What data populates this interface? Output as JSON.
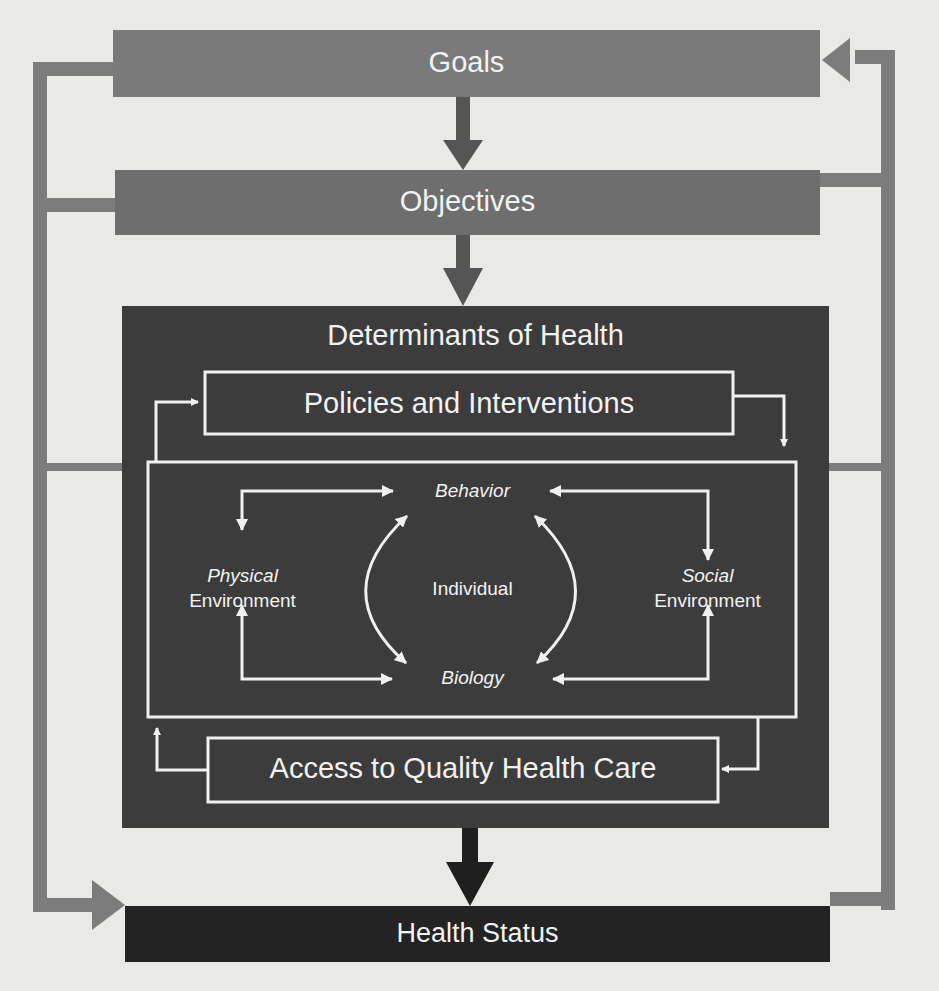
{
  "diagram": {
    "colors": {
      "background": "#e9e9e6",
      "goals_box": "#7a7a7a",
      "objectives_box": "#6e6e6e",
      "determinants_box": "#3c3c3c",
      "health_status_box": "#232323",
      "feedback_lines": "#7c7c7c",
      "inner_lines": "#f0f0f0",
      "text": "#f2f2f2"
    },
    "nodes": {
      "goals": "Goals",
      "objectives": "Objectives",
      "determinants_title": "Determinants of Health",
      "policies": "Policies and Interventions",
      "behavior": "Behavior",
      "physical_1": "Physical",
      "physical_2": "Environment",
      "individual": "Individual",
      "social_1": "Social",
      "social_2": "Environment",
      "biology": "Biology",
      "access": "Access to Quality Health Care",
      "health_status": "Health Status"
    },
    "edges": [
      {
        "from": "Goals",
        "to": "Objectives"
      },
      {
        "from": "Objectives",
        "to": "Determinants of Health"
      },
      {
        "from": "Determinants of Health",
        "to": "Health Status"
      },
      {
        "from": "Health Status",
        "to": "Goals",
        "type": "feedback"
      },
      {
        "from": "Goals",
        "to": "Health Status",
        "type": "feedback"
      },
      {
        "from": "Policies and Interventions",
        "to": "Access to Quality Health Care"
      },
      {
        "from": "Access to Quality Health Care",
        "to": "Policies and Interventions"
      },
      {
        "from": "Behavior",
        "to": "Physical Environment",
        "bidirectional": true
      },
      {
        "from": "Behavior",
        "to": "Social Environment",
        "bidirectional": true
      },
      {
        "from": "Biology",
        "to": "Physical Environment",
        "bidirectional": true
      },
      {
        "from": "Biology",
        "to": "Social Environment",
        "bidirectional": true
      },
      {
        "from": "Behavior",
        "to": "Biology",
        "bidirectional": true
      }
    ]
  }
}
